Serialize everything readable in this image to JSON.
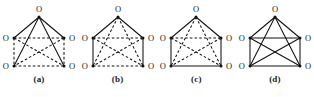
{
  "figure": {
    "panel_count": 4,
    "vertex_label": "O",
    "vertex_count": 5,
    "edge_count": 10,
    "colors": {
      "background": "#ffffff",
      "edge": "#111111",
      "vertex": "#111111",
      "label": "#1a1a1a"
    }
  },
  "panels": [
    {
      "caption": "(a)",
      "vertices": [
        {
          "name": "top",
          "label": "O",
          "x": 39,
          "y": 17
        },
        {
          "name": "upper-left",
          "label": "O",
          "x": 14,
          "y": 38
        },
        {
          "name": "upper-right",
          "label": "O",
          "x": 64,
          "y": 38
        },
        {
          "name": "lower-left",
          "label": "O",
          "x": 14,
          "y": 66
        },
        {
          "name": "lower-right",
          "label": "O",
          "x": 64,
          "y": 66
        }
      ],
      "edges": [
        {
          "from": "top",
          "to": "upper-left",
          "style": "solid"
        },
        {
          "from": "top",
          "to": "upper-right",
          "style": "solid"
        },
        {
          "from": "top",
          "to": "lower-left",
          "style": "solid"
        },
        {
          "from": "top",
          "to": "lower-right",
          "style": "solid"
        },
        {
          "from": "upper-left",
          "to": "upper-right",
          "style": "dashed"
        },
        {
          "from": "upper-left",
          "to": "lower-left",
          "style": "dashed"
        },
        {
          "from": "upper-right",
          "to": "lower-right",
          "style": "dashed"
        },
        {
          "from": "lower-left",
          "to": "lower-right",
          "style": "dashed"
        },
        {
          "from": "upper-left",
          "to": "lower-right",
          "style": "dashed"
        },
        {
          "from": "upper-right",
          "to": "lower-left",
          "style": "dashed"
        }
      ],
      "solid_edge_count": 4,
      "dashed_edge_count": 6
    },
    {
      "caption": "(b)",
      "vertices": [
        {
          "name": "top",
          "label": "O",
          "x": 39,
          "y": 17
        },
        {
          "name": "upper-left",
          "label": "O",
          "x": 14,
          "y": 38
        },
        {
          "name": "upper-right",
          "label": "O",
          "x": 64,
          "y": 38
        },
        {
          "name": "lower-left",
          "label": "O",
          "x": 14,
          "y": 66
        },
        {
          "name": "lower-right",
          "label": "O",
          "x": 64,
          "y": 66
        }
      ],
      "edges": [
        {
          "from": "top",
          "to": "upper-left",
          "style": "solid"
        },
        {
          "from": "top",
          "to": "upper-right",
          "style": "solid"
        },
        {
          "from": "top",
          "to": "lower-left",
          "style": "dashed"
        },
        {
          "from": "top",
          "to": "lower-right",
          "style": "dashed"
        },
        {
          "from": "upper-left",
          "to": "upper-right",
          "style": "dashed"
        },
        {
          "from": "upper-left",
          "to": "lower-left",
          "style": "solid"
        },
        {
          "from": "upper-right",
          "to": "lower-right",
          "style": "solid"
        },
        {
          "from": "lower-left",
          "to": "lower-right",
          "style": "dashed"
        },
        {
          "from": "upper-left",
          "to": "lower-right",
          "style": "dashed"
        },
        {
          "from": "upper-right",
          "to": "lower-left",
          "style": "dashed"
        }
      ],
      "solid_edge_count": 4,
      "dashed_edge_count": 6
    },
    {
      "caption": "(c)",
      "vertices": [
        {
          "name": "top",
          "label": "O",
          "x": 39,
          "y": 17
        },
        {
          "name": "upper-left",
          "label": "O",
          "x": 14,
          "y": 38
        },
        {
          "name": "upper-right",
          "label": "O",
          "x": 64,
          "y": 38
        },
        {
          "name": "lower-left",
          "label": "O",
          "x": 14,
          "y": 66
        },
        {
          "name": "lower-right",
          "label": "O",
          "x": 64,
          "y": 66
        }
      ],
      "edges": [
        {
          "from": "top",
          "to": "upper-left",
          "style": "solid"
        },
        {
          "from": "top",
          "to": "upper-right",
          "style": "solid"
        },
        {
          "from": "top",
          "to": "lower-left",
          "style": "dashed"
        },
        {
          "from": "top",
          "to": "lower-right",
          "style": "dashed"
        },
        {
          "from": "upper-left",
          "to": "upper-right",
          "style": "dashed"
        },
        {
          "from": "upper-left",
          "to": "lower-left",
          "style": "solid"
        },
        {
          "from": "upper-right",
          "to": "lower-right",
          "style": "solid"
        },
        {
          "from": "lower-left",
          "to": "lower-right",
          "style": "solid"
        },
        {
          "from": "upper-left",
          "to": "lower-right",
          "style": "dashed"
        },
        {
          "from": "upper-right",
          "to": "lower-left",
          "style": "dashed"
        }
      ],
      "solid_edge_count": 5,
      "dashed_edge_count": 5
    },
    {
      "caption": "(d)",
      "vertices": [
        {
          "name": "top",
          "label": "O",
          "x": 39,
          "y": 17
        },
        {
          "name": "upper-left",
          "label": "O",
          "x": 14,
          "y": 38
        },
        {
          "name": "upper-right",
          "label": "O",
          "x": 64,
          "y": 38
        },
        {
          "name": "lower-left",
          "label": "O",
          "x": 14,
          "y": 66
        },
        {
          "name": "lower-right",
          "label": "O",
          "x": 64,
          "y": 66
        }
      ],
      "edges": [
        {
          "from": "top",
          "to": "upper-left",
          "style": "solid"
        },
        {
          "from": "top",
          "to": "upper-right",
          "style": "solid"
        },
        {
          "from": "top",
          "to": "lower-left",
          "style": "solid"
        },
        {
          "from": "top",
          "to": "lower-right",
          "style": "solid"
        },
        {
          "from": "upper-left",
          "to": "upper-right",
          "style": "solid"
        },
        {
          "from": "upper-left",
          "to": "lower-left",
          "style": "solid"
        },
        {
          "from": "upper-right",
          "to": "lower-right",
          "style": "solid"
        },
        {
          "from": "lower-left",
          "to": "lower-right",
          "style": "solid"
        },
        {
          "from": "upper-left",
          "to": "lower-right",
          "style": "solid"
        },
        {
          "from": "upper-right",
          "to": "lower-left",
          "style": "solid"
        }
      ],
      "solid_edge_count": 10,
      "dashed_edge_count": 0
    }
  ]
}
